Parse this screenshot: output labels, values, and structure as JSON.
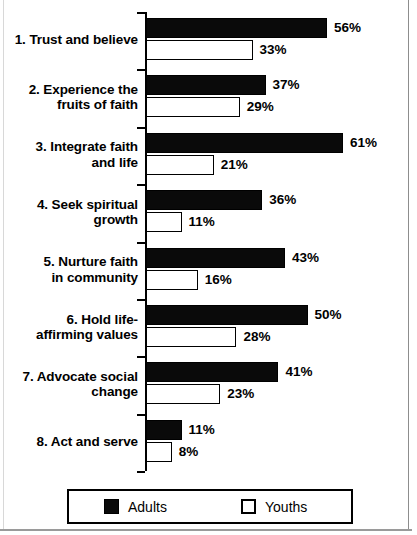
{
  "chart_data": {
    "type": "bar",
    "orientation": "horizontal",
    "title": "",
    "subtitle": "",
    "xlabel": "",
    "ylabel": "",
    "grid": false,
    "xlim": [
      0,
      65
    ],
    "value_suffix": "%",
    "legend_position": "bottom",
    "categories": [
      "1. Trust and believe",
      "2. Experience the fruits of faith",
      "3. Integrate faith and life",
      "4. Seek spiritual growth",
      "5. Nurture faith in community",
      "6. Hold life-affirming values",
      "7. Advocate social change",
      "8. Act and serve"
    ],
    "category_lines": [
      [
        "1. Trust and believe"
      ],
      [
        "2. Experience the",
        "fruits of faith"
      ],
      [
        "3. Integrate faith",
        "and life"
      ],
      [
        "4. Seek spiritual",
        "growth"
      ],
      [
        "5. Nurture faith",
        "in community"
      ],
      [
        "6. Hold life-",
        "affirming values"
      ],
      [
        "7. Advocate social",
        "change"
      ],
      [
        "8. Act and serve"
      ]
    ],
    "series": [
      {
        "name": "Adults",
        "color": "#0a0a0a",
        "style": "filled",
        "values": [
          56,
          37,
          61,
          36,
          43,
          50,
          41,
          11
        ],
        "labels": [
          "56%",
          "37%",
          "61%",
          "36%",
          "43%",
          "50%",
          "41%",
          "11%"
        ]
      },
      {
        "name": "Youths",
        "color": "#ffffff",
        "style": "hollow",
        "values": [
          33,
          29,
          21,
          11,
          16,
          28,
          23,
          8
        ],
        "labels": [
          "33%",
          "29%",
          "21%",
          "11%",
          "16%",
          "28%",
          "23%",
          "8%"
        ]
      }
    ]
  },
  "legend": {
    "items": [
      {
        "label": "Adults",
        "style": "filled"
      },
      {
        "label": "Youths",
        "style": "hollow"
      }
    ]
  }
}
